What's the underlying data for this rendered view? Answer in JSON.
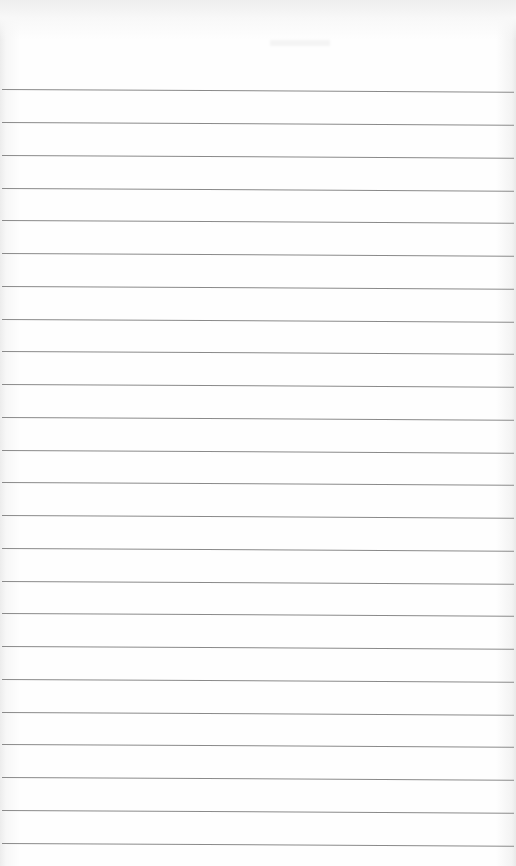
{
  "page": {
    "type": "ruled-notebook-paper",
    "background_color": "#fdfdfd",
    "line_color": "#8a8a8a",
    "line_count": 24,
    "line_spacing_px": 32.7,
    "first_line_y": 89,
    "lines": [
      89,
      122,
      155,
      188,
      220,
      253,
      286,
      319,
      351,
      384,
      417,
      450,
      482,
      515,
      548,
      581,
      613,
      646,
      679,
      712,
      744,
      777,
      810,
      843
    ],
    "text": ""
  }
}
